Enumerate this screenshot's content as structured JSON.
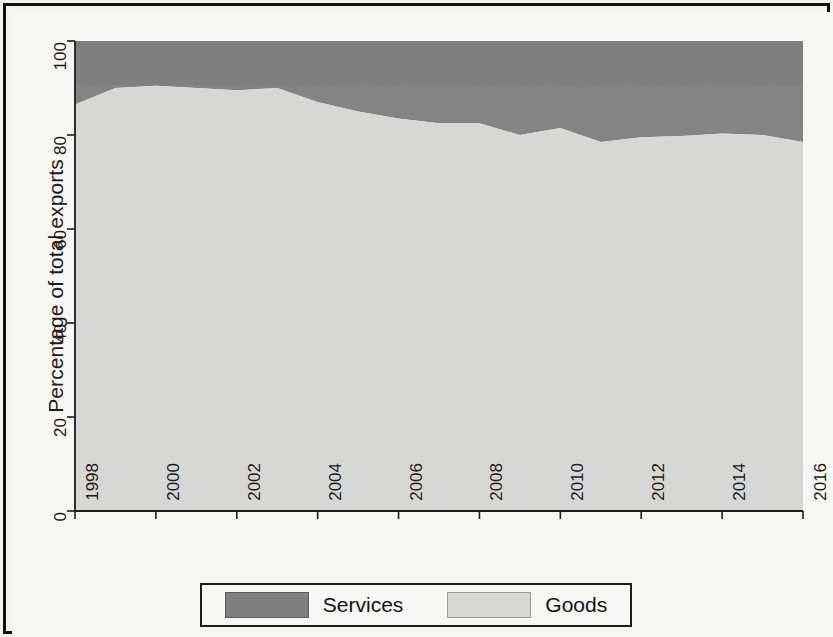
{
  "chart_data": {
    "type": "area",
    "subtype": "stacked-area-100-percent",
    "title": "",
    "xlabel": "",
    "ylabel": "Percentage of total exports",
    "xlim": [
      1998,
      2016
    ],
    "ylim": [
      0,
      100
    ],
    "grid": false,
    "legend_position": "bottom-outside",
    "x": [
      1998,
      1999,
      2000,
      2001,
      2002,
      2003,
      2004,
      2005,
      2006,
      2007,
      2008,
      2009,
      2010,
      2011,
      2012,
      2013,
      2014,
      2015,
      2016
    ],
    "xticks": [
      "1998",
      "2000",
      "2002",
      "2004",
      "2006",
      "2008",
      "2010",
      "2012",
      "2014",
      "2016"
    ],
    "xtick_values": [
      1998,
      2000,
      2002,
      2004,
      2006,
      2008,
      2010,
      2012,
      2014,
      2016
    ],
    "yticks": [
      "0",
      "20",
      "40",
      "60",
      "80",
      "100"
    ],
    "ytick_values": [
      0,
      20,
      40,
      60,
      80,
      100
    ],
    "series": [
      {
        "name": "Goods",
        "color": "#d7d7d5",
        "values": [
          86.5,
          90.0,
          90.5,
          90.0,
          89.5,
          90.0,
          87.0,
          85.0,
          83.5,
          82.5,
          82.5,
          80.0,
          81.5,
          78.5,
          79.5,
          79.8,
          80.3,
          80.0,
          78.5
        ]
      },
      {
        "name": "Services",
        "color": "#7f7f7f",
        "values": [
          13.5,
          10.0,
          9.5,
          10.0,
          10.5,
          10.0,
          13.0,
          15.0,
          16.5,
          17.5,
          17.5,
          20.0,
          18.5,
          21.5,
          20.5,
          20.2,
          19.7,
          20.0,
          21.5
        ]
      }
    ]
  },
  "legend": {
    "entries": [
      {
        "label": "Services",
        "color": "#7f7f7f"
      },
      {
        "label": "Goods",
        "color": "#d7d7d5"
      }
    ]
  },
  "axes": {
    "y_title": "Percentage of total exports"
  }
}
